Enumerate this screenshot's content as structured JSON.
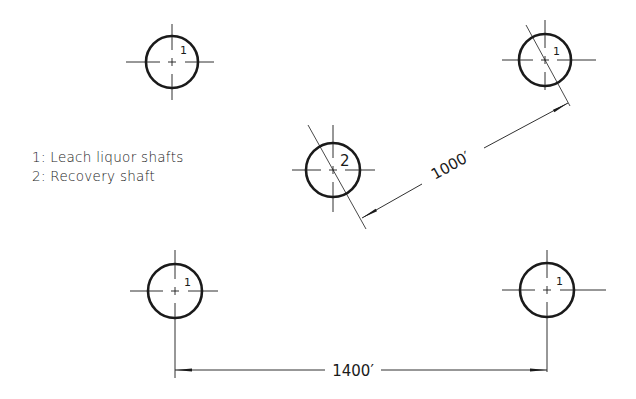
{
  "legend": {
    "items": [
      {
        "label": "1: Leach liquor shafts"
      },
      {
        "label": "2: Recovery shaft"
      }
    ]
  },
  "shafts": [
    {
      "id": "top-left",
      "label": "1",
      "cx": 172,
      "cy": 62,
      "r": 26
    },
    {
      "id": "top-right",
      "label": "1",
      "cx": 545,
      "cy": 60,
      "r": 26
    },
    {
      "id": "center",
      "label": "2",
      "cx": 333,
      "cy": 170,
      "r": 27
    },
    {
      "id": "bottom-left",
      "label": "1",
      "cx": 175,
      "cy": 291,
      "r": 27
    },
    {
      "id": "bottom-right",
      "label": "1",
      "cx": 547,
      "cy": 290,
      "r": 27
    }
  ],
  "dimensions": {
    "horizontal": {
      "label": "1400′"
    },
    "diagonal": {
      "label": "1000′"
    }
  },
  "colors": {
    "ink": "#1a1a1a",
    "background": "#ffffff"
  }
}
